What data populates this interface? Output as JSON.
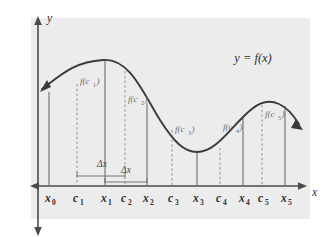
{
  "figure": {
    "type": "riemann-sum-diagram",
    "title_label": "y = f(x)",
    "axis": {
      "x_label": "x",
      "y_label": "y"
    },
    "colors": {
      "plot_background": "#ececed",
      "curve": "#3a3a3a",
      "axis": "#4a4a4a",
      "solid_partition_line": "#6e6e6e",
      "dashed_sample_line": "#8d8d8d",
      "label_text": "#5a5a5a",
      "axis_label_text": "#2e2e2e",
      "page_background": "#ffffff"
    },
    "x_axis_ticks": [
      {
        "name": "x0",
        "label": "x",
        "sub": "0",
        "kind": "partition",
        "px": 49
      },
      {
        "name": "c1",
        "label": "c",
        "sub": "1",
        "kind": "sample",
        "px": 77
      },
      {
        "name": "x1",
        "label": "x",
        "sub": "1",
        "kind": "partition",
        "px": 105
      },
      {
        "name": "c2",
        "label": "c",
        "sub": "2",
        "kind": "sample",
        "px": 125
      },
      {
        "name": "x2",
        "label": "x",
        "sub": "2",
        "kind": "partition",
        "px": 147
      },
      {
        "name": "c3",
        "label": "c",
        "sub": "3",
        "kind": "sample",
        "px": 172
      },
      {
        "name": "x3",
        "label": "x",
        "sub": "3",
        "kind": "partition",
        "px": 197
      },
      {
        "name": "c4",
        "label": "c",
        "sub": "4",
        "kind": "sample",
        "px": 220
      },
      {
        "name": "x4",
        "label": "x",
        "sub": "4",
        "kind": "partition",
        "px": 243
      },
      {
        "name": "c5",
        "label": "c",
        "sub": "5",
        "kind": "sample",
        "px": 262
      },
      {
        "name": "x5",
        "label": "x",
        "sub": "5",
        "kind": "partition",
        "px": 285
      }
    ],
    "height_labels": [
      {
        "name": "f-c1",
        "text": "f(c",
        "sub": "1",
        "close": ")",
        "px": 80,
        "py": 84
      },
      {
        "name": "f-c2",
        "text": "f(c",
        "sub": "2",
        "close": ")",
        "px": 128,
        "py": 102
      },
      {
        "name": "f-c3",
        "text": "f(c",
        "sub": "3",
        "close": ")",
        "px": 175,
        "py": 132
      },
      {
        "name": "f-c4",
        "text": "f(c",
        "sub": "4",
        "close": ")",
        "px": 223,
        "py": 130
      },
      {
        "name": "f-c5",
        "text": "f(c",
        "sub": "5",
        "close": ")",
        "px": 265,
        "py": 117
      }
    ],
    "delta_x_labels": [
      {
        "name": "delta-x-left",
        "text": "Δx",
        "px": 102,
        "py": 167,
        "bar_from": 77,
        "bar_to": 125,
        "bar_y": 176
      },
      {
        "name": "delta-x-right",
        "text": "Δx",
        "px": 126,
        "py": 173,
        "bar_from": 105,
        "bar_to": 147,
        "bar_y": 182
      }
    ]
  },
  "chart_data": {
    "type": "line",
    "title": "y = f(x)",
    "xlabel": "x",
    "ylabel": "y",
    "grid": false,
    "legend": "none",
    "partition_points": [
      "x0",
      "x1",
      "x2",
      "x3",
      "x4",
      "x5"
    ],
    "sample_points": [
      "c1",
      "c2",
      "c3",
      "c4",
      "c5"
    ],
    "rectangle_heights": [
      "f(c1)",
      "f(c2)",
      "f(c3)",
      "f(c4)",
      "f(c5)"
    ],
    "subinterval_width": "Δx"
  }
}
